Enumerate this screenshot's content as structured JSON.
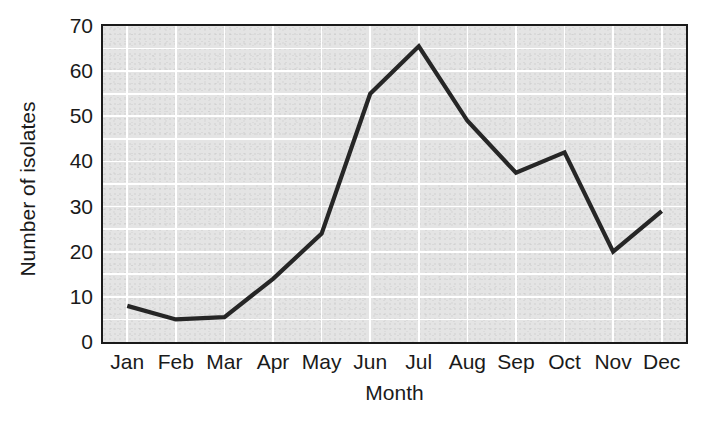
{
  "chart_data": {
    "type": "line",
    "title": "",
    "xlabel": "Month",
    "ylabel": "Number of isolates",
    "categories": [
      "Jan",
      "Feb",
      "Mar",
      "Apr",
      "May",
      "Jun",
      "Jul",
      "Aug",
      "Sep",
      "Oct",
      "Nov",
      "Dec"
    ],
    "values": [
      8,
      5,
      5.5,
      14,
      24,
      55,
      65.5,
      49,
      37.5,
      42,
      20,
      29
    ],
    "series": [
      {
        "name": "Number of isolates",
        "values": [
          8,
          5,
          5.5,
          14,
          24,
          55,
          65.5,
          49,
          37.5,
          42,
          20,
          29
        ]
      }
    ],
    "ylim": [
      0,
      70
    ],
    "ytick_labels": [
      "0",
      "10",
      "20",
      "30",
      "40",
      "50",
      "60",
      "70"
    ],
    "ytick_values": [
      0,
      10,
      20,
      30,
      40,
      50,
      60,
      70
    ],
    "xtick_labels": [
      "Jan",
      "Feb",
      "Mar",
      "Apr",
      "May",
      "Jun",
      "Jul",
      "Aug",
      "Sep",
      "Oct",
      "Nov",
      "Dec"
    ],
    "grid": true,
    "grid_minor_step": 5,
    "legend": "none",
    "line_color": "#262626",
    "plot_background": "#e4e4e4",
    "gridline_color": "#ffffff",
    "axis_color": "#1a1a1a"
  }
}
